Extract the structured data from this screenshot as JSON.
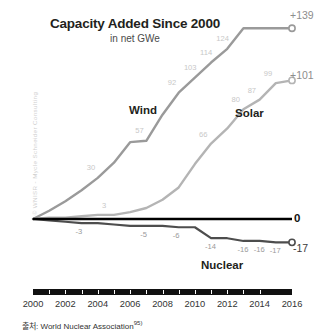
{
  "chart_data": {
    "type": "line",
    "title": "Capacity Added Since 2000",
    "subtitle": "in net GWe",
    "xlabel": "",
    "ylabel": "",
    "x": [
      2000,
      2001,
      2002,
      2003,
      2004,
      2005,
      2006,
      2007,
      2008,
      2009,
      2010,
      2011,
      2012,
      2013,
      2014,
      2015,
      2016
    ],
    "tick_labels": [
      "2000",
      "2002",
      "2004",
      "2006",
      "2008",
      "2010",
      "2012",
      "2014",
      "2016"
    ],
    "xlim": [
      2000,
      2016
    ],
    "ylim": [
      -25,
      145
    ],
    "grid": false,
    "legend": "inline-labels",
    "series": [
      {
        "name": "Wind",
        "color": "#9a9a9a",
        "values": [
          0,
          6,
          13,
          21,
          30,
          41,
          56,
          57,
          76,
          92,
          103,
          114,
          124,
          139,
          139,
          139,
          139
        ],
        "point_labels": [
          "",
          "",
          "",
          "",
          "30",
          "",
          "",
          "57",
          "",
          "92",
          "103",
          "114",
          "124",
          "",
          "",
          "",
          ""
        ],
        "end_label": "+139",
        "end_value": 139
      },
      {
        "name": "Solar",
        "color": "#b4b4b4",
        "values": [
          0,
          1,
          1,
          2,
          3,
          3,
          5,
          8,
          14,
          23,
          40,
          55,
          66,
          80,
          87,
          99,
          101
        ],
        "point_labels": [
          "",
          "",
          "",
          "",
          "",
          "3",
          "",
          "",
          "",
          "",
          "",
          "66",
          "",
          "80",
          "87",
          "99",
          ""
        ],
        "end_label": "+101",
        "end_value": 101
      },
      {
        "name": "Nuclear",
        "color": "#4d4d4d",
        "values": [
          0,
          -1,
          -2,
          -3,
          -3,
          -4,
          -5,
          -5,
          -5,
          -6,
          -6,
          -14,
          -14,
          -16,
          -16,
          -17,
          -17
        ],
        "point_labels": [
          "",
          "",
          "",
          "-3",
          "",
          "",
          "",
          "-5",
          "",
          "-6",
          "",
          "-14",
          "",
          "-16",
          "-16",
          "-17",
          ""
        ],
        "end_label": "-17",
        "end_value": -17
      }
    ],
    "zero_line": {
      "value": 0,
      "label": "0",
      "color": "#000000"
    },
    "annotations": {
      "watermark": "© WNISR - Mycle Schneider Consulting"
    }
  },
  "source": {
    "prefix": "출처:",
    "text": "World Nuclear Association",
    "footnote": "95)"
  }
}
